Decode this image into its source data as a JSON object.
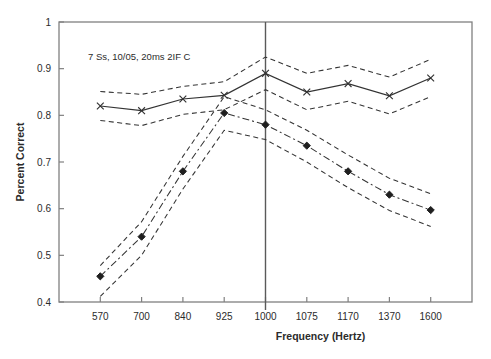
{
  "chart_data": {
    "type": "line",
    "title": "",
    "xlabel": "Frequency (Hertz)",
    "ylabel": "Percent Correct",
    "annotation": "7 Ss,    10/05,    20ms      2IF C",
    "grid": false,
    "legend": null,
    "x": [
      570,
      700,
      840,
      925,
      1000,
      1075,
      1170,
      1370,
      1600
    ],
    "xtick_labels": [
      "570",
      "700",
      "840",
      "925",
      "1000",
      "1075",
      "1170",
      "1370",
      "1600"
    ],
    "ytick_labels": [
      "0.4",
      "0.5",
      "0.6",
      "0.7",
      "0.8",
      "0.9",
      "1"
    ],
    "ylim": [
      0.4,
      1.0
    ],
    "ytick_values": [
      0.4,
      0.5,
      0.6,
      0.7,
      0.8,
      0.9,
      1.0
    ],
    "reference_line_x": 1000,
    "series": [
      {
        "name": "upper-solid-x",
        "marker": "x",
        "style": "solid",
        "values": [
          0.82,
          0.81,
          0.835,
          0.843,
          0.89,
          0.85,
          0.868,
          0.842,
          0.88
        ]
      },
      {
        "name": "upper-band-high",
        "marker": "none",
        "style": "dashed",
        "values": [
          0.851,
          0.845,
          0.862,
          0.872,
          0.925,
          0.89,
          0.907,
          0.882,
          0.92
        ]
      },
      {
        "name": "upper-band-low",
        "marker": "none",
        "style": "dashed",
        "values": [
          0.789,
          0.778,
          0.802,
          0.812,
          0.855,
          0.812,
          0.83,
          0.803,
          0.84
        ]
      },
      {
        "name": "lower-dashdot-diamond",
        "marker": "diamond",
        "style": "dash-dot",
        "values": [
          0.455,
          0.54,
          0.68,
          0.805,
          0.78,
          0.735,
          0.68,
          0.63,
          0.597
        ]
      },
      {
        "name": "lower-band-high",
        "marker": "none",
        "style": "dashed",
        "values": [
          0.478,
          0.572,
          0.712,
          0.84,
          0.812,
          0.768,
          0.715,
          0.665,
          0.632
        ]
      },
      {
        "name": "lower-band-low",
        "marker": "none",
        "style": "dashed",
        "values": [
          0.412,
          0.5,
          0.642,
          0.768,
          0.748,
          0.7,
          0.645,
          0.596,
          0.562
        ]
      }
    ]
  },
  "colors": {
    "line": "#333333",
    "axis": "#808080",
    "text": "#2b2b2b",
    "background": "#ffffff"
  }
}
